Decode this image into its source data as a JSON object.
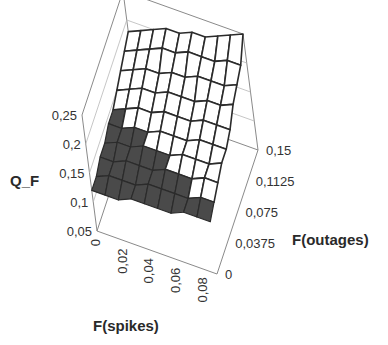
{
  "chart_data": {
    "type": "surface3d",
    "title": "",
    "zlabel": "Q_F",
    "xlabel": "F(spikes)",
    "ylabel": "F(outages)",
    "z_ticks": [
      "0,05",
      "0,1",
      "0,15",
      "0,2",
      "0,25"
    ],
    "x_ticks": [
      "0",
      "0,02",
      "0,04",
      "0,06",
      "0,08"
    ],
    "y_ticks": [
      "0",
      "0,0375",
      "0,075",
      "0,1125",
      "0,15"
    ],
    "zlim": [
      0.05,
      0.25
    ],
    "xlim": [
      0,
      0.09
    ],
    "ylim": [
      0,
      0.15
    ],
    "grid_size": [
      10,
      10
    ],
    "color_bands": [
      {
        "range": [
          0.05,
          0.15
        ],
        "color": "#4a4a4a"
      },
      {
        "range": [
          0.15,
          0.25
        ],
        "color": "#ffffff"
      }
    ],
    "z_values_note": "Q_F rows indexed by F(spikes) 0..0.09 (front to back-left), columns by F(outages) 0..0.15",
    "z": [
      [
        0.12,
        0.12,
        0.13,
        0.13,
        0.14,
        0.14,
        0.15,
        0.16,
        0.17,
        0.18
      ],
      [
        0.12,
        0.13,
        0.13,
        0.14,
        0.14,
        0.15,
        0.16,
        0.17,
        0.18,
        0.19
      ],
      [
        0.12,
        0.13,
        0.14,
        0.14,
        0.15,
        0.16,
        0.17,
        0.18,
        0.19,
        0.2
      ],
      [
        0.13,
        0.13,
        0.14,
        0.15,
        0.15,
        0.16,
        0.17,
        0.18,
        0.2,
        0.21
      ],
      [
        0.13,
        0.14,
        0.14,
        0.15,
        0.16,
        0.17,
        0.18,
        0.19,
        0.2,
        0.21
      ],
      [
        0.13,
        0.14,
        0.15,
        0.15,
        0.16,
        0.17,
        0.18,
        0.19,
        0.21,
        0.22
      ],
      [
        0.13,
        0.14,
        0.15,
        0.16,
        0.16,
        0.17,
        0.18,
        0.2,
        0.21,
        0.22
      ],
      [
        0.14,
        0.14,
        0.15,
        0.16,
        0.17,
        0.18,
        0.19,
        0.2,
        0.21,
        0.23
      ],
      [
        0.14,
        0.15,
        0.16,
        0.16,
        0.17,
        0.18,
        0.19,
        0.2,
        0.22,
        0.24
      ],
      [
        0.14,
        0.15,
        0.16,
        0.17,
        0.17,
        0.18,
        0.2,
        0.21,
        0.22,
        0.25
      ]
    ]
  },
  "labels": {
    "zlabel": "Q_F",
    "xlabel": "F(spikes)",
    "ylabel": "F(outages)"
  }
}
